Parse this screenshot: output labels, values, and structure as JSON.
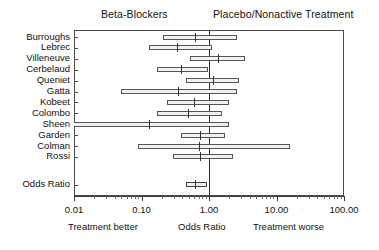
{
  "header": {
    "left_group": "Beta-Blockers",
    "right_group": "Placebo/Nonactive Treatment"
  },
  "footer": {
    "left_note": "Treatment better",
    "center_note": "Odds Ratio",
    "right_note": "Treatment worse"
  },
  "axis": {
    "tick_labels": [
      "0.01",
      "0.10",
      "1.00",
      "10.00",
      "100.00"
    ],
    "tick_values": [
      0.01,
      0.1,
      1,
      10,
      100
    ],
    "scale": "log10",
    "xlim": [
      0.01,
      100
    ],
    "null_value": 1.0
  },
  "chart_data": {
    "type": "forest",
    "title": "",
    "subtitle": "",
    "xlabel": "Odds Ratio",
    "ylabel": "",
    "xlim": [
      0.01,
      100
    ],
    "scale": "log10",
    "null_line": 1.0,
    "grid": false,
    "legend": "none",
    "categories": [
      "Burroughs",
      "Lebrec",
      "Villeneuve",
      "Cerbelaud",
      "Queniet",
      "Gatta",
      "Kobeet",
      "Colombo",
      "Sheen",
      "Garden",
      "Colman",
      "Rossi",
      "Odds Ratio"
    ],
    "annotations": [
      "Beta-Blockers",
      "Placebo/Nonactive Treatment",
      "Treatment better",
      "Treatment worse"
    ],
    "rows": [
      {
        "label": "Burroughs",
        "or": 0.62,
        "lo": 0.21,
        "hi": 2.6,
        "summary": false,
        "clipped_low": false
      },
      {
        "label": "Lebrec",
        "or": 0.34,
        "lo": 0.13,
        "hi": 1.1,
        "summary": false,
        "clipped_low": false
      },
      {
        "label": "Villeneuve",
        "or": 1.35,
        "lo": 0.52,
        "hi": 3.4,
        "summary": false,
        "clipped_low": false
      },
      {
        "label": "Cerbelaud",
        "or": 0.39,
        "lo": 0.17,
        "hi": 0.98,
        "summary": false,
        "clipped_low": false
      },
      {
        "label": "Queniet",
        "or": 1.14,
        "lo": 0.45,
        "hi": 2.8,
        "summary": false,
        "clipped_low": false
      },
      {
        "label": "Gatta",
        "or": 0.35,
        "lo": 0.05,
        "hi": 2.6,
        "summary": false,
        "clipped_low": false
      },
      {
        "label": "Kobeet",
        "or": 0.6,
        "lo": 0.24,
        "hi": 2.0,
        "summary": false,
        "clipped_low": false
      },
      {
        "label": "Colombo",
        "or": 0.49,
        "lo": 0.17,
        "hi": 1.55,
        "summary": false,
        "clipped_low": false
      },
      {
        "label": "Sheen",
        "or": 0.13,
        "lo": 0.01,
        "hi": 2.0,
        "summary": false,
        "clipped_low": true
      },
      {
        "label": "Garden",
        "or": 0.74,
        "lo": 0.38,
        "hi": 1.75,
        "summary": false,
        "clipped_low": false
      },
      {
        "label": "Colman",
        "or": 0.7,
        "lo": 0.09,
        "hi": 16.0,
        "summary": false,
        "clipped_low": false
      },
      {
        "label": "Rossi",
        "or": 0.74,
        "lo": 0.29,
        "hi": 2.3,
        "summary": false,
        "clipped_low": false
      },
      {
        "label": "Odds Ratio",
        "or": 0.61,
        "lo": 0.45,
        "hi": 0.95,
        "summary": true,
        "clipped_low": false
      }
    ]
  }
}
